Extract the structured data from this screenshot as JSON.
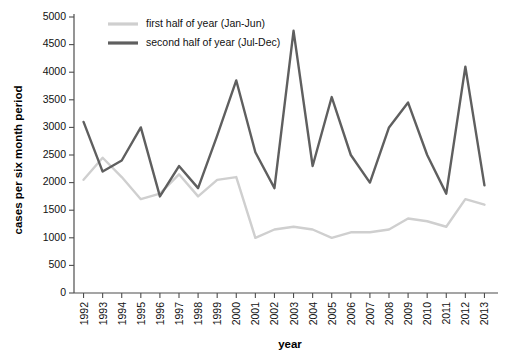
{
  "chart_data": {
    "type": "line",
    "title": "",
    "xlabel": "year",
    "ylabel": "cases per six month period",
    "x": [
      1992,
      1993,
      1994,
      1995,
      1996,
      1997,
      1998,
      1999,
      2000,
      2001,
      2002,
      2003,
      2004,
      2005,
      2006,
      2007,
      2008,
      2009,
      2010,
      2011,
      2012,
      2013
    ],
    "categories": [
      "1992",
      "1993",
      "1994",
      "1995",
      "1996",
      "1997",
      "1998",
      "1999",
      "2000",
      "2001",
      "2002",
      "2003",
      "2004",
      "2005",
      "2006",
      "2007",
      "2008",
      "2009",
      "2010",
      "2011",
      "2012",
      "2013"
    ],
    "series": [
      {
        "name": "first half of year (Jan-Jun)",
        "color": "#cfcfcf",
        "values": [
          2050,
          2450,
          2100,
          1700,
          1800,
          2150,
          1750,
          2050,
          2100,
          1000,
          1150,
          1200,
          1150,
          1000,
          1100,
          1100,
          1150,
          1350,
          1300,
          1200,
          1700,
          1600
        ]
      },
      {
        "name": "second half of year (Jul-Dec)",
        "color": "#5f5f5f",
        "values": [
          3100,
          2200,
          2400,
          3000,
          1750,
          2300,
          1900,
          2850,
          3850,
          2550,
          1900,
          4750,
          2300,
          3550,
          2500,
          2000,
          3000,
          3450,
          2500,
          1800,
          4100,
          1950
        ]
      }
    ],
    "xlim": [
      1991.5,
      2013.5
    ],
    "ylim": [
      0,
      5000
    ],
    "yticks": [
      0,
      500,
      1000,
      1500,
      2000,
      2500,
      3000,
      3500,
      4000,
      4500,
      5000
    ],
    "ytick_labels": [
      "0",
      "500",
      "1000",
      "1500",
      "2000",
      "2500",
      "3000",
      "3500",
      "4000",
      "4500",
      "5000"
    ],
    "grid": false,
    "legend_position": "top-left"
  },
  "legend": {
    "items": [
      {
        "label": "first half of year (Jan-Jun)",
        "color": "#cfcfcf"
      },
      {
        "label": "second half of year (Jul-Dec)",
        "color": "#5f5f5f"
      }
    ]
  },
  "axes": {
    "x_title": "year",
    "y_title": "cases per six month period"
  }
}
